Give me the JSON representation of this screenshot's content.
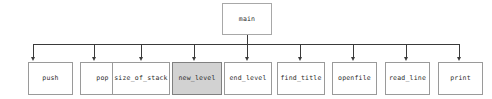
{
  "diagram": {
    "background_color": "#ffffff",
    "edge_color": "#3a3a3a",
    "node_border_color": "#9a9a9a",
    "node_fill_color": "#ffffff",
    "highlight_fill_color": "#d2d2d2",
    "highlight_border_color": "#808080",
    "text_color": "#2b2b2b",
    "root": {
      "label": "main",
      "x": 222,
      "y": 3,
      "width": 50,
      "height": 32,
      "highlighted": false
    },
    "bus": {
      "y": 44,
      "x_start": 33,
      "x_end": 459
    },
    "children": [
      {
        "label": "push",
        "x": 28,
        "y": 62,
        "width": 45,
        "height": 33,
        "stem_x": 33,
        "highlighted": false
      },
      {
        "label": "pop",
        "x": 80,
        "y": 62,
        "width": 45,
        "height": 33,
        "stem_x": 94,
        "highlighted": false
      },
      {
        "label": "size_of_stack",
        "x": 112,
        "y": 62,
        "width": 58,
        "height": 33,
        "stem_x": 141,
        "highlighted": false
      },
      {
        "label": "new_level",
        "x": 172,
        "y": 62,
        "width": 50,
        "height": 33,
        "stem_x": 194,
        "highlighted": true
      },
      {
        "label": "end_level",
        "x": 224,
        "y": 62,
        "width": 48,
        "height": 33,
        "stem_x": 247,
        "highlighted": false
      },
      {
        "label": "find_title",
        "x": 277,
        "y": 62,
        "width": 48,
        "height": 33,
        "stem_x": 300,
        "highlighted": false
      },
      {
        "label": "openfile",
        "x": 332,
        "y": 62,
        "width": 45,
        "height": 33,
        "stem_x": 353,
        "highlighted": false
      },
      {
        "label": "read_line",
        "x": 385,
        "y": 62,
        "width": 45,
        "height": 33,
        "stem_x": 406,
        "highlighted": false
      },
      {
        "label": "print",
        "x": 438,
        "y": 62,
        "width": 45,
        "height": 33,
        "stem_x": 459,
        "highlighted": false
      }
    ]
  }
}
